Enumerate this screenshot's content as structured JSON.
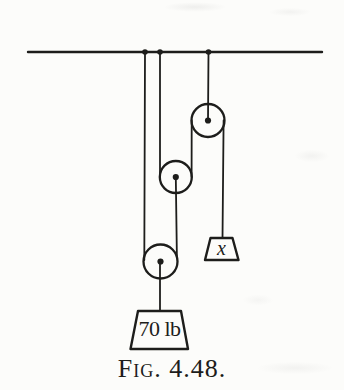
{
  "figure": {
    "caption": "Fig. 4.48.",
    "labels": {
      "main_weight": "70 lb",
      "unknown_weight": "x"
    },
    "colors": {
      "ink": "#1d1d1b",
      "paper": "#fcfcfa"
    }
  }
}
